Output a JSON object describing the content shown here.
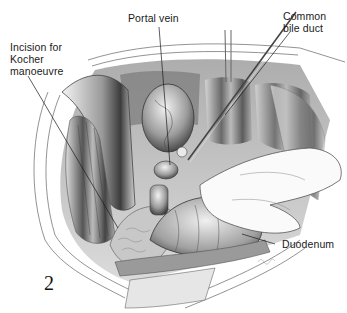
{
  "figure": {
    "number": "2",
    "style": "monochrome pencil surgical illustration",
    "colors": {
      "background": "#ffffff",
      "ink": "#1a1a1a",
      "shade_dark": "#4a4a4a",
      "shade_mid": "#8c8c8c",
      "shade_light": "#d0d0d0"
    }
  },
  "labels": {
    "portal_vein": "Portal vein",
    "common_bile_duct": "Common\nbile duct",
    "kocher_incision": "Incision for\nKocher\nmanoeuvre",
    "duodenum": "Duodenum"
  }
}
